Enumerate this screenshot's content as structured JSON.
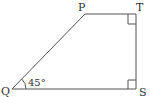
{
  "figure": {
    "type": "geometry-trapezoid",
    "stroke_color": "#555555",
    "vertices": [
      {
        "name": "P",
        "label": "P",
        "x": 85,
        "y": 14
      },
      {
        "name": "T",
        "label": "T",
        "x": 136,
        "y": 14
      },
      {
        "name": "S",
        "label": "S",
        "x": 136,
        "y": 89
      },
      {
        "name": "Q",
        "label": "Q",
        "x": 12,
        "y": 89
      }
    ],
    "segments": [
      "QP",
      "PT",
      "TS",
      "SQ"
    ],
    "right_angles": [
      "T",
      "S"
    ],
    "angle": {
      "vertex": "Q",
      "label": "45°",
      "degrees": 45
    }
  }
}
